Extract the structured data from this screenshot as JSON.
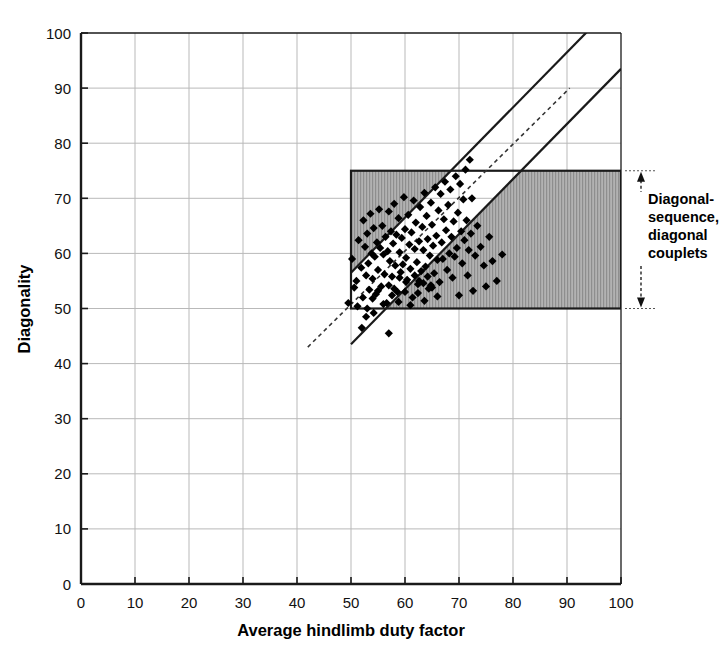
{
  "chart_data": {
    "type": "scatter",
    "title": "",
    "xlabel": "Average hindlimb duty factor",
    "ylabel": "Diagonality",
    "xlim": [
      0,
      100
    ],
    "ylim": [
      0,
      100
    ],
    "xticks": [
      0,
      10,
      20,
      30,
      40,
      50,
      60,
      70,
      80,
      90,
      100
    ],
    "yticks": [
      0,
      10,
      20,
      30,
      40,
      50,
      60,
      70,
      80,
      90,
      100
    ],
    "grid": true,
    "legend_position": "none",
    "marker": "filled-diamond",
    "marker_color": "#000000",
    "series": [
      {
        "name": "Primate gait records",
        "points": [
          [
            50.2,
            59.0
          ],
          [
            51.0,
            55.0
          ],
          [
            51.4,
            62.4
          ],
          [
            51.9,
            57.4
          ],
          [
            52.0,
            46.5
          ],
          [
            52.3,
            66.0
          ],
          [
            52.6,
            61.2
          ],
          [
            52.8,
            56.0
          ],
          [
            53.0,
            63.6
          ],
          [
            53.2,
            58.2
          ],
          [
            53.4,
            53.4
          ],
          [
            53.6,
            67.2
          ],
          [
            53.8,
            60.0
          ],
          [
            54.0,
            55.4
          ],
          [
            54.2,
            64.6
          ],
          [
            54.4,
            59.4
          ],
          [
            54.6,
            52.6
          ],
          [
            54.8,
            62.0
          ],
          [
            55.0,
            57.0
          ],
          [
            55.2,
            68.0
          ],
          [
            55.4,
            61.0
          ],
          [
            55.6,
            54.0
          ],
          [
            55.8,
            65.0
          ],
          [
            56.0,
            59.8
          ],
          [
            56.2,
            56.2
          ],
          [
            56.4,
            63.0
          ],
          [
            56.6,
            51.0
          ],
          [
            56.8,
            60.4
          ],
          [
            57.0,
            45.5
          ],
          [
            57.0,
            67.6
          ],
          [
            57.2,
            58.6
          ],
          [
            57.4,
            64.0
          ],
          [
            57.6,
            55.8
          ],
          [
            57.8,
            61.8
          ],
          [
            58.0,
            69.0
          ],
          [
            58.2,
            57.8
          ],
          [
            58.4,
            63.4
          ],
          [
            58.6,
            53.0
          ],
          [
            58.8,
            66.4
          ],
          [
            59.0,
            60.2
          ],
          [
            59.2,
            56.6
          ],
          [
            59.4,
            62.8
          ],
          [
            59.6,
            58.0
          ],
          [
            59.8,
            70.2
          ],
          [
            60.0,
            64.4
          ],
          [
            60.2,
            59.2
          ],
          [
            60.4,
            55.2
          ],
          [
            60.6,
            67.0
          ],
          [
            60.8,
            61.6
          ],
          [
            61.0,
            57.2
          ],
          [
            61.2,
            63.8
          ],
          [
            61.4,
            52.0
          ],
          [
            61.6,
            69.6
          ],
          [
            61.8,
            60.8
          ],
          [
            62.0,
            65.6
          ],
          [
            62.2,
            58.4
          ],
          [
            62.4,
            54.4
          ],
          [
            62.6,
            62.2
          ],
          [
            62.8,
            68.4
          ],
          [
            63.0,
            56.8
          ],
          [
            63.2,
            64.8
          ],
          [
            63.4,
            60.6
          ],
          [
            63.6,
            71.0
          ],
          [
            63.8,
            57.6
          ],
          [
            64.0,
            66.8
          ],
          [
            64.2,
            62.6
          ],
          [
            64.4,
            53.6
          ],
          [
            64.6,
            59.6
          ],
          [
            64.8,
            69.2
          ],
          [
            65.0,
            65.2
          ],
          [
            65.2,
            61.4
          ],
          [
            65.4,
            56.4
          ],
          [
            65.6,
            72.0
          ],
          [
            65.8,
            63.2
          ],
          [
            66.0,
            58.8
          ],
          [
            66.2,
            67.8
          ],
          [
            66.4,
            54.8
          ],
          [
            66.6,
            70.8
          ],
          [
            66.8,
            62.0
          ],
          [
            67.0,
            59.0
          ],
          [
            67.2,
            66.2
          ],
          [
            67.4,
            73.0
          ],
          [
            67.6,
            64.2
          ],
          [
            67.8,
            57.0
          ],
          [
            68.0,
            68.8
          ],
          [
            68.2,
            60.0
          ],
          [
            68.4,
            71.6
          ],
          [
            68.6,
            63.0
          ],
          [
            68.8,
            55.6
          ],
          [
            69.0,
            65.8
          ],
          [
            69.2,
            59.4
          ],
          [
            69.4,
            74.0
          ],
          [
            69.6,
            61.0
          ],
          [
            69.8,
            67.4
          ],
          [
            70.0,
            52.4
          ],
          [
            70.2,
            72.6
          ],
          [
            70.4,
            64.0
          ],
          [
            70.6,
            58.2
          ],
          [
            70.8,
            69.8
          ],
          [
            71.0,
            62.4
          ],
          [
            71.2,
            75.2
          ],
          [
            71.4,
            66.0
          ],
          [
            71.6,
            56.0
          ],
          [
            71.8,
            60.6
          ],
          [
            72.0,
            77.0
          ],
          [
            72.2,
            63.6
          ],
          [
            72.4,
            70.0
          ],
          [
            72.6,
            53.2
          ],
          [
            73.0,
            59.6
          ],
          [
            73.4,
            65.0
          ],
          [
            74.0,
            61.2
          ],
          [
            74.6,
            57.8
          ],
          [
            75.0,
            54.0
          ],
          [
            75.6,
            63.0
          ],
          [
            76.2,
            58.6
          ],
          [
            77.0,
            55.0
          ],
          [
            78.0,
            59.8
          ],
          [
            49.5,
            51.0
          ],
          [
            50.6,
            53.8
          ],
          [
            51.2,
            50.4
          ],
          [
            52.2,
            52.0
          ],
          [
            53.0,
            50.0
          ],
          [
            54.0,
            51.8
          ],
          [
            55.0,
            53.2
          ],
          [
            56.0,
            50.8
          ],
          [
            57.6,
            52.4
          ],
          [
            58.8,
            51.2
          ],
          [
            60.0,
            53.0
          ],
          [
            61.0,
            50.6
          ],
          [
            62.4,
            52.8
          ],
          [
            63.6,
            51.4
          ],
          [
            64.8,
            54.2
          ],
          [
            66.0,
            52.2
          ],
          [
            61.8,
            56.0
          ],
          [
            62.6,
            55.0
          ],
          [
            63.4,
            54.6
          ],
          [
            64.2,
            55.8
          ],
          [
            65.0,
            53.8
          ],
          [
            59.0,
            55.6
          ],
          [
            60.2,
            54.8
          ],
          [
            57.0,
            54.2
          ],
          [
            58.0,
            53.6
          ],
          [
            52.8,
            48.5
          ],
          [
            54.2,
            49.2
          ]
        ]
      }
    ],
    "regions": [
      {
        "name": "diagonal-sequence-diagonal-couplets-box",
        "shape": "rect",
        "x_range": [
          50,
          100
        ],
        "y_range": [
          50,
          75
        ],
        "fill": "#a9a9a9",
        "hatch": "vertical-fine",
        "stroke": "#1a1a1a"
      },
      {
        "name": "lateral-band-cutout",
        "shape": "diagonal-band",
        "description": "white unshaded band parallel to identity line",
        "lower_line": [
          [
            50,
            43.5
          ],
          [
            100,
            93.5
          ]
        ],
        "upper_line": [
          [
            50,
            56.5
          ],
          [
            100,
            106.5
          ]
        ],
        "fill": "#ffffff",
        "stroke": "#1a1a1a"
      }
    ],
    "reference_line": {
      "name": "identity-line",
      "style": "dashed",
      "from": [
        42.0,
        43.0
      ],
      "to": [
        90.5,
        90.0
      ],
      "color": "#333333"
    },
    "annotations": [
      {
        "name": "bracket-label",
        "text_lines": [
          "Diagonal-",
          "sequence,",
          "diagonal",
          "couplets"
        ],
        "bracket_y_range": [
          50,
          75
        ],
        "bracket_x": 103
      }
    ]
  },
  "axes": {
    "x": {
      "label": "Average hindlimb duty factor",
      "ticks": [
        "0",
        "10",
        "20",
        "30",
        "40",
        "50",
        "60",
        "70",
        "80",
        "90",
        "100"
      ]
    },
    "y": {
      "label": "Diagonality",
      "ticks": [
        "0",
        "10",
        "20",
        "30",
        "40",
        "50",
        "60",
        "70",
        "80",
        "90",
        "100"
      ]
    }
  },
  "annotation": {
    "line1": "Diagonal-",
    "line2": "sequence,",
    "line3": "diagonal",
    "line4": "couplets"
  },
  "colors": {
    "grid": "#b9b9b9",
    "axis": "#1a1a1a",
    "marker": "#000000",
    "region_fill": "#a9a9a9",
    "background": "#ffffff"
  }
}
